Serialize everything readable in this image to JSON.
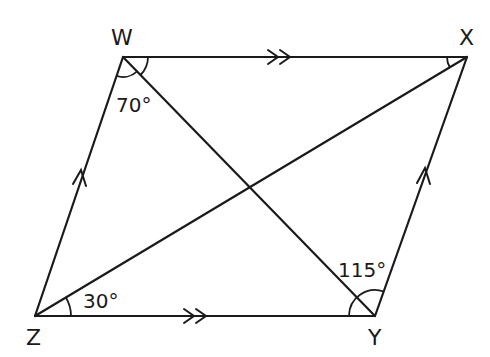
{
  "diagram": {
    "type": "parallelogram",
    "vertices": [
      {
        "name": "W",
        "x": 123,
        "y": 57,
        "label_x": 111,
        "label_y": 45
      },
      {
        "name": "X",
        "x": 467,
        "y": 57,
        "label_x": 459,
        "label_y": 45
      },
      {
        "name": "Y",
        "x": 375,
        "y": 316,
        "label_x": 368,
        "label_y": 345
      },
      {
        "name": "Z",
        "x": 35,
        "y": 316,
        "label_x": 26,
        "label_y": 345
      }
    ],
    "sides": [
      {
        "from": "W",
        "to": "X",
        "marker": "double-arrow"
      },
      {
        "from": "Z",
        "to": "Y",
        "marker": "double-arrow"
      },
      {
        "from": "Z",
        "to": "W",
        "marker": "single-arrow"
      },
      {
        "from": "Y",
        "to": "X",
        "marker": "single-arrow"
      }
    ],
    "diagonals": [
      {
        "from": "W",
        "to": "Y"
      },
      {
        "from": "Z",
        "to": "X"
      }
    ],
    "angles": [
      {
        "vertex": "W",
        "between": "ZW-WY",
        "label": "70°",
        "label_x": 130,
        "label_y": 112
      },
      {
        "vertex": "W",
        "between": "WY-WX",
        "label": "",
        "marked": true
      },
      {
        "vertex": "X",
        "between": "WX-XZ",
        "label": "",
        "marked": true
      },
      {
        "vertex": "Z",
        "between": "ZX-ZY",
        "label": "30°",
        "label_x": 83,
        "label_y": 308
      },
      {
        "vertex": "Y",
        "between": "ZY-YX",
        "label": "115°",
        "label_x": 338,
        "label_y": 276
      }
    ],
    "labels": {
      "W": "W",
      "X": "X",
      "Y": "Y",
      "Z": "Z",
      "angle_W": "70°",
      "angle_Z": "30°",
      "angle_Y": "115°"
    },
    "colors": {
      "stroke": "#1a1a1a",
      "background": "#ffffff"
    }
  }
}
